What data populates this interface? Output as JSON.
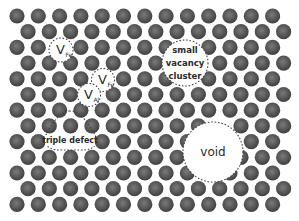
{
  "diagram": {
    "title": "Point defects in a crystal lattice",
    "lattice": {
      "rows": 13,
      "cols": 13,
      "x0_odd": 17,
      "x0_even": 28,
      "dx": 21.3,
      "y0": 16,
      "dy": 15.7,
      "atom_radius": 7.6,
      "atom_color_center": "#7a7a7a",
      "atom_color_edge": "#3e3e3e"
    },
    "defects": [
      {
        "id": "v-fe-1",
        "type": "circle",
        "cx": 61,
        "cy": 50,
        "r": 12,
        "label_main": "V",
        "label_sub": "Fe",
        "clear_r": 10
      },
      {
        "id": "v-fe-2",
        "type": "circle",
        "cx": 103,
        "cy": 80,
        "r": 11.5,
        "label_main": "V",
        "label_sub": "Fe",
        "clear_r": 9
      },
      {
        "id": "v-al",
        "type": "circle",
        "cx": 89,
        "cy": 95,
        "r": 11.5,
        "label_main": "V",
        "label_sub": "Al",
        "clear_r": 9
      },
      {
        "id": "small-vacancy-cluster",
        "type": "circle",
        "cx": 185,
        "cy": 63,
        "r": 23,
        "lines": [
          "small",
          "vacancy",
          "cluster"
        ],
        "clear_r": 21
      },
      {
        "id": "void",
        "type": "circle",
        "cx": 213,
        "cy": 152,
        "r": 30,
        "lines": [
          "void"
        ],
        "clear_r": 27
      }
    ],
    "triple_defect": {
      "label": "triple defect",
      "path": "M70 111 C60 111, 52 124, 47 133 C42 142, 46 150, 60 150 L82 150 C96 150, 99 142, 94 133 C88 123, 80 111, 70 111 Z",
      "text_x": 70,
      "text_y": 143,
      "clear_points": [
        [
          60,
          144
        ],
        [
          81,
          144
        ]
      ]
    },
    "outline_color": "#444444"
  }
}
